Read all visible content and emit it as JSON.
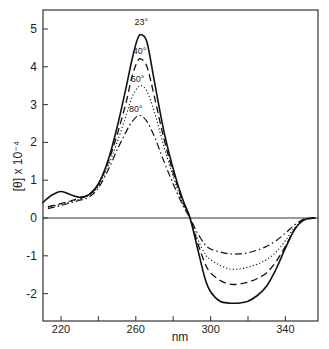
{
  "chart_data": {
    "type": "line",
    "title": "",
    "xlabel": "nm",
    "ylabel": "[θ] x 10⁻⁴",
    "xlim": [
      210,
      357
    ],
    "ylim": [
      -2.7,
      5.5
    ],
    "x_ticks": [
      220,
      240,
      260,
      280,
      300,
      320,
      340
    ],
    "x_tick_labels": [
      "220",
      "",
      "260",
      "",
      "300",
      "",
      "340"
    ],
    "y_ticks": [
      -2,
      -1,
      0,
      1,
      2,
      3,
      4,
      5
    ],
    "y_tick_labels": [
      "-2",
      "-1",
      "0",
      "1",
      "2",
      "3",
      "4",
      "5"
    ],
    "grid": false,
    "legend": "inline labels at peaks",
    "zero_line": true,
    "series": [
      {
        "name": "23°",
        "style": "solid",
        "x": [
          210,
          215,
          220,
          225,
          230,
          235,
          240,
          245,
          250,
          255,
          258,
          261,
          263,
          266,
          270,
          275,
          280,
          285,
          289,
          293,
          297,
          300,
          305,
          310,
          315,
          320,
          325,
          330,
          335,
          340,
          345,
          350,
          356
        ],
        "y": [
          0.4,
          0.6,
          0.7,
          0.62,
          0.55,
          0.62,
          0.9,
          1.5,
          2.4,
          3.5,
          4.2,
          4.75,
          4.85,
          4.65,
          3.6,
          2.3,
          1.3,
          0.5,
          0.0,
          -0.8,
          -1.6,
          -1.95,
          -2.2,
          -2.25,
          -2.25,
          -2.2,
          -2.05,
          -1.8,
          -1.35,
          -0.8,
          -0.3,
          -0.05,
          0.0
        ]
      },
      {
        "name": "40°",
        "style": "dashed",
        "x": [
          213,
          220,
          225,
          230,
          235,
          240,
          245,
          250,
          255,
          258,
          261,
          263,
          266,
          270,
          275,
          280,
          285,
          289,
          293,
          297,
          300,
          305,
          310,
          315,
          320,
          325,
          330,
          335,
          340,
          345,
          350,
          356
        ],
        "y": [
          0.3,
          0.38,
          0.45,
          0.52,
          0.62,
          0.9,
          1.45,
          2.2,
          3.1,
          3.75,
          4.15,
          4.2,
          4.0,
          3.2,
          2.1,
          1.2,
          0.45,
          0.0,
          -0.65,
          -1.2,
          -1.45,
          -1.65,
          -1.75,
          -1.75,
          -1.7,
          -1.6,
          -1.45,
          -1.15,
          -0.75,
          -0.3,
          -0.05,
          0.0
        ]
      },
      {
        "name": "60°",
        "style": "dotted",
        "x": [
          213,
          220,
          225,
          230,
          235,
          240,
          245,
          250,
          255,
          258,
          261,
          263,
          266,
          270,
          275,
          280,
          285,
          289,
          293,
          297,
          300,
          305,
          310,
          315,
          320,
          325,
          330,
          335,
          340,
          345,
          350,
          356
        ],
        "y": [
          0.28,
          0.36,
          0.43,
          0.5,
          0.6,
          0.85,
          1.35,
          2.0,
          2.75,
          3.2,
          3.45,
          3.5,
          3.35,
          2.8,
          1.9,
          1.1,
          0.4,
          0.0,
          -0.55,
          -0.95,
          -1.1,
          -1.25,
          -1.35,
          -1.35,
          -1.3,
          -1.22,
          -1.1,
          -0.9,
          -0.6,
          -0.25,
          -0.05,
          0.0
        ]
      },
      {
        "name": "80°",
        "style": "dash-dot",
        "x": [
          213,
          220,
          225,
          230,
          235,
          240,
          245,
          250,
          255,
          258,
          261,
          263,
          266,
          270,
          275,
          280,
          285,
          289,
          293,
          297,
          300,
          305,
          310,
          315,
          320,
          325,
          330,
          335,
          340,
          345,
          350,
          356
        ],
        "y": [
          0.25,
          0.33,
          0.4,
          0.47,
          0.55,
          0.8,
          1.25,
          1.8,
          2.3,
          2.55,
          2.7,
          2.7,
          2.55,
          2.15,
          1.5,
          0.9,
          0.35,
          0.0,
          -0.4,
          -0.7,
          -0.82,
          -0.9,
          -0.95,
          -0.95,
          -0.92,
          -0.85,
          -0.75,
          -0.6,
          -0.4,
          -0.18,
          -0.03,
          0.0
        ]
      }
    ],
    "annotations": [
      {
        "text": "23°",
        "x": 263,
        "y": 5.1
      },
      {
        "text": "40°",
        "x": 262,
        "y": 4.35
      },
      {
        "text": "60°",
        "x": 261,
        "y": 3.6
      },
      {
        "text": "80°",
        "x": 260,
        "y": 2.8
      }
    ]
  }
}
